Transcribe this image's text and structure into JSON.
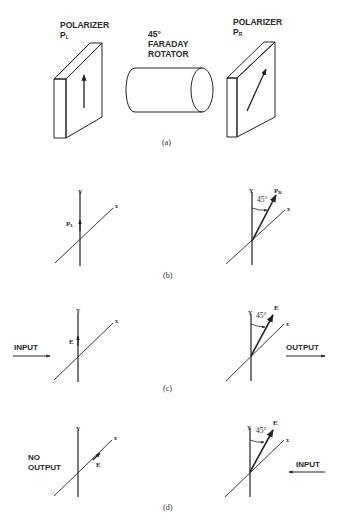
{
  "panel_a": {
    "left_polarizer": {
      "title": "POLARIZER",
      "symbol": "P",
      "subscript": "L"
    },
    "rotator": {
      "line1": "45°",
      "line2": "FARADAY",
      "line3": "ROTATOR"
    },
    "right_polarizer": {
      "title": "POLARIZER",
      "symbol": "P",
      "subscript": "R"
    },
    "caption": "(a)"
  },
  "panel_b": {
    "left": {
      "y_label": "Y",
      "x_label": "x",
      "vector_symbol": "P",
      "vector_subscript": "L"
    },
    "right": {
      "y_label": "Y",
      "x_label": "x",
      "angle_label": "45°",
      "vector_symbol": "P",
      "vector_subscript": "R"
    },
    "caption": "(b)"
  },
  "panel_c": {
    "left": {
      "y_label": "Y",
      "x_label": "x",
      "vector_label": "E",
      "beam_label": "INPUT"
    },
    "right": {
      "y_label": "Y",
      "x_label": "x",
      "angle_label": "45°",
      "vector_label": "E",
      "beam_label": "OUTPUT"
    },
    "caption": "(c)"
  },
  "panel_d": {
    "left": {
      "y_label": "Y",
      "x_label": "x",
      "vector_label": "E",
      "beam_label_line1": "NO",
      "beam_label_line2": "OUTPUT"
    },
    "right": {
      "y_label": "Y",
      "x_label": "x",
      "angle_label": "45°",
      "vector_label": "E",
      "beam_label": "INPUT"
    },
    "caption": "(d)"
  },
  "colors": {
    "ink": "#222222",
    "background": "#ffffff"
  }
}
